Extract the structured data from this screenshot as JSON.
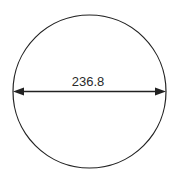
{
  "diagram": {
    "shape": "circle",
    "dimension": {
      "type": "diameter",
      "label": "236.8",
      "arrows": "both-ends"
    },
    "colors": {
      "stroke": "#222222",
      "background": "#ffffff",
      "text": "#2a2a2a"
    }
  }
}
